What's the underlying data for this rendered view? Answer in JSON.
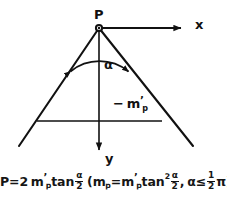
{
  "figure": {
    "name": "cone-of-influence-diagram",
    "background_color": "#ffffff",
    "ink_color": "#111111",
    "labels": {
      "apex_point": "P",
      "x_axis": "x",
      "y_axis": "y",
      "angle": "α",
      "interior_minus": "−",
      "interior_symbol_base": "m",
      "interior_symbol_prime": "’",
      "interior_symbol_sub": "p"
    },
    "formula": {
      "text": "P = 2 m’p tan α/2  (mp = m’p tan² α/2, α ≤ ½π)",
      "lhs": "P",
      "equals": "=",
      "coefficient": "2",
      "m_base": "m",
      "m_prime": "’",
      "m_sub": "p",
      "tan": "tan",
      "half_num": "α",
      "half_den": "2",
      "paren_open": "(",
      "paren_close": ")",
      "tan_squared_sup": "2",
      "comma": ",",
      "alpha": "α",
      "leq": "≤",
      "pi": "π",
      "one": "1",
      "two": "2"
    },
    "geometry": {
      "apex": [
        99,
        28
      ],
      "left_leg_end": [
        19,
        146
      ],
      "right_leg_end": [
        193,
        146
      ],
      "x_axis_end": [
        190,
        28
      ],
      "y_axis_end": [
        99,
        158
      ],
      "horizontal_chord_y": 121,
      "horizontal_chord_x1": 37,
      "horizontal_chord_x2": 162,
      "angle_arc_radius": 44
    }
  }
}
